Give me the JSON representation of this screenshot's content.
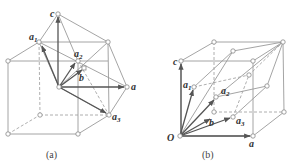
{
  "figure": {
    "panels": [
      {
        "caption": "(a)",
        "labels": {
          "c": "c",
          "a1": "a",
          "a1_sub": "1",
          "a2": "a",
          "a2_sub": "2",
          "b": "b",
          "a": "a",
          "a3": "a",
          "a3_sub": "3"
        }
      },
      {
        "caption": "(b)",
        "labels": {
          "c": "c",
          "a1": "a",
          "a1_sub": "1",
          "a2": "a",
          "a2_sub": "2",
          "b": "b",
          "a3": "a",
          "a3_sub": "3",
          "O": "O",
          "a": "a"
        }
      }
    ],
    "colors": {
      "edge": "#9a9a9a",
      "vector": "#555555",
      "label": "#333333"
    }
  }
}
